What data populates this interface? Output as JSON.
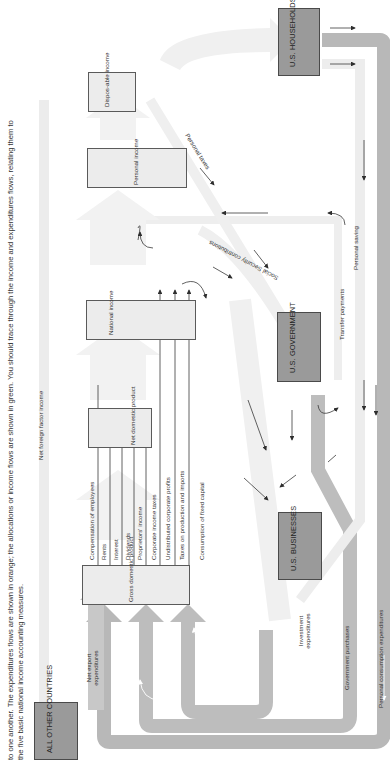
{
  "caption": {
    "lines": [
      "to one another. The expenditures flows are shown in orange; the allocations or income flows are shown in green. You should trace through the income and expenditures flows, relating them to",
      "the five basic national income accounting measures."
    ]
  },
  "sectors": {
    "households": "U.S. HOUSEHOLDS",
    "government": "U.S. GOVERNMENT",
    "businesses": "U.S. BUSINESSES",
    "other_countries": "ALL OTHER COUNTRIES"
  },
  "measures": {
    "gdp": "Gross domestic product",
    "ndp": "Net domestic product",
    "national_income": "National income",
    "personal_income": "Personal income",
    "disposable_income": "Dispos-able income"
  },
  "income_components": [
    "Compensation of employees",
    "Rents",
    "Interest",
    "Dividends",
    "Proprietors' income",
    "Corporate income taxes",
    "Undistributed corporate profits",
    "Taxes on production and imports",
    "Consumption of fixed capital"
  ],
  "flows": {
    "net_foreign_factor_income": "Net foreign factor income",
    "net_export_expenditures": "Net export expenditures",
    "investment_expenditures": "Investment expenditures",
    "government_purchases": "Government purchases",
    "personal_consumption_expenditures": "Personal consumption expenditures",
    "personal_saving": "Personal saving",
    "transfer_payments": "Transfer payments",
    "personal_taxes": "Personal taxes",
    "social_security_contributions": "Social Security contributions"
  },
  "colors": {
    "flow_dark": "#b4b4b4",
    "flow_mid": "#c8c8c8",
    "flow_light": "#e6e6e6",
    "flow_faint": "#f0f0f0",
    "sector_box": "#9a9a9a",
    "measure_box": "#ececec",
    "line": "#3a3a3a"
  }
}
